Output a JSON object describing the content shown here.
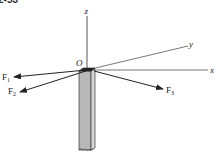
{
  "figure": {
    "number_label": "2-53",
    "origin_label": "O",
    "axes": {
      "x": "x",
      "y": "y",
      "z": "z"
    },
    "forces": [
      {
        "name": "F",
        "subscript": "1"
      },
      {
        "name": "F",
        "subscript": "2"
      },
      {
        "name": "F",
        "subscript": "3"
      }
    ]
  }
}
